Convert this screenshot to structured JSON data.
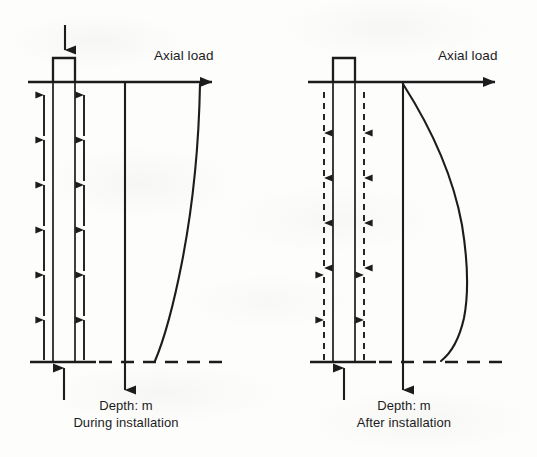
{
  "figure": {
    "background_color": "#fdfdfc",
    "ink_color": "#1c1c1c",
    "width": 537,
    "height": 457
  },
  "panels": [
    {
      "id": "during-installation",
      "axis_label_top": "Axial load",
      "axis_label_depth": "Depth: m",
      "caption": "During installation",
      "head_load_arrow": "downward",
      "toe_reaction_arrow": "upward",
      "shaft_friction_direction": "upward",
      "shaft_friction_line_style": "solid",
      "shaft_arrow_count_per_side": 6,
      "curve_description": "Load decreases with depth: near-vertical at the head then curving left toward the toe",
      "geometry": {
        "ground_line_y": 82,
        "ground_line_x0": 28,
        "ground_line_x1": 225,
        "base_line_y": 362,
        "base_line_x0": 30,
        "base_line_x1": 225,
        "pile_left_x": 53,
        "pile_right_x": 75,
        "pile_head_top_y": 58,
        "depth_axis_x": 125,
        "curve_top_x": 200,
        "curve_base_x": 155
      }
    },
    {
      "id": "after-installation",
      "axis_label_top": "Axial load",
      "axis_label_depth": "Depth: m",
      "caption": "After installation",
      "head_load_arrow": "none",
      "toe_reaction_arrow": "upward",
      "shaft_friction_direction": "downward in upper shaft, upward in lower shaft",
      "shaft_friction_line_style": "dashed",
      "shaft_arrow_count_per_side": 6,
      "shaft_downward_arrow_count": 4,
      "shaft_upward_arrow_count": 2,
      "curve_description": "Residual load: bulges to the right reaching a maximum near mid-depth then returns toward the toe",
      "geometry": {
        "ground_line_y": 82,
        "ground_line_x0": 308,
        "ground_line_x1": 508,
        "base_line_y": 362,
        "base_line_x0": 310,
        "base_line_x1": 508,
        "pile_left_x": 333,
        "pile_right_x": 355,
        "pile_head_top_y": 58,
        "depth_axis_x": 403,
        "curve_top_x": 403,
        "curve_max_x": 468,
        "curve_base_x": 440
      }
    }
  ],
  "icons": {
    "load-arrow": "downward-filled-arrow",
    "reaction-arrow": "upward-filled-arrow",
    "axis-arrow": "right-filled-arrow",
    "depth-arrow": "downward-filled-arrow"
  }
}
